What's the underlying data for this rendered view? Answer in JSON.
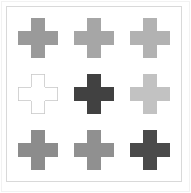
{
  "figure": {
    "background_color": "#ffffff",
    "outer_frame_color": "#f2f2f2",
    "panel_border_color": "#d9d9d9",
    "rows": 3,
    "columns": 3
  },
  "chart_data": {
    "type": "heatmap",
    "title": "",
    "subtitle": "",
    "xlabel": "",
    "ylabel": "",
    "grid": false,
    "legend_position": "none",
    "xticklabels": [],
    "yticklabels": [],
    "marker": "plus-cross",
    "categories": [
      "col-1",
      "col-2",
      "col-3"
    ],
    "row_labels": [
      "row-1",
      "row-2",
      "row-3"
    ],
    "series": [
      {
        "name": "row-1",
        "values": [
          0.55,
          0.6,
          0.67
        ]
      },
      {
        "name": "row-2",
        "values": [
          1.0,
          0.25,
          0.75
        ]
      },
      {
        "name": "row-3",
        "values": [
          0.52,
          0.54,
          0.28
        ]
      }
    ],
    "cells": [
      {
        "id": "cross-r1c1",
        "row": 1,
        "column": 1,
        "shape": "plus-cross",
        "fill": "#9a9a9a",
        "stroke": "none",
        "filled": true,
        "value": 0.55
      },
      {
        "id": "cross-r1c2",
        "row": 1,
        "column": 2,
        "shape": "plus-cross",
        "fill": "#a6a6a6",
        "stroke": "none",
        "filled": true,
        "value": 0.6
      },
      {
        "id": "cross-r1c3",
        "row": 1,
        "column": 3,
        "shape": "plus-cross",
        "fill": "#b2b2b2",
        "stroke": "none",
        "filled": true,
        "value": 0.67
      },
      {
        "id": "cross-r2c1",
        "row": 2,
        "column": 1,
        "shape": "plus-cross",
        "fill": "#ffffff",
        "stroke": "#c9c9c9",
        "filled": false,
        "value": 1.0
      },
      {
        "id": "cross-r2c2",
        "row": 2,
        "column": 2,
        "shape": "plus-cross",
        "fill": "#414141",
        "stroke": "none",
        "filled": true,
        "value": 0.25
      },
      {
        "id": "cross-r2c3",
        "row": 2,
        "column": 3,
        "shape": "plus-cross",
        "fill": "#c2c2c2",
        "stroke": "none",
        "filled": true,
        "value": 0.75
      },
      {
        "id": "cross-r3c1",
        "row": 3,
        "column": 1,
        "shape": "plus-cross",
        "fill": "#8c8c8c",
        "stroke": "none",
        "filled": true,
        "value": 0.52
      },
      {
        "id": "cross-r3c2",
        "row": 3,
        "column": 2,
        "shape": "plus-cross",
        "fill": "#909090",
        "stroke": "none",
        "filled": true,
        "value": 0.54
      },
      {
        "id": "cross-r3c3",
        "row": 3,
        "column": 3,
        "shape": "plus-cross",
        "fill": "#4a4a4a",
        "stroke": "none",
        "filled": true,
        "value": 0.28
      }
    ]
  }
}
